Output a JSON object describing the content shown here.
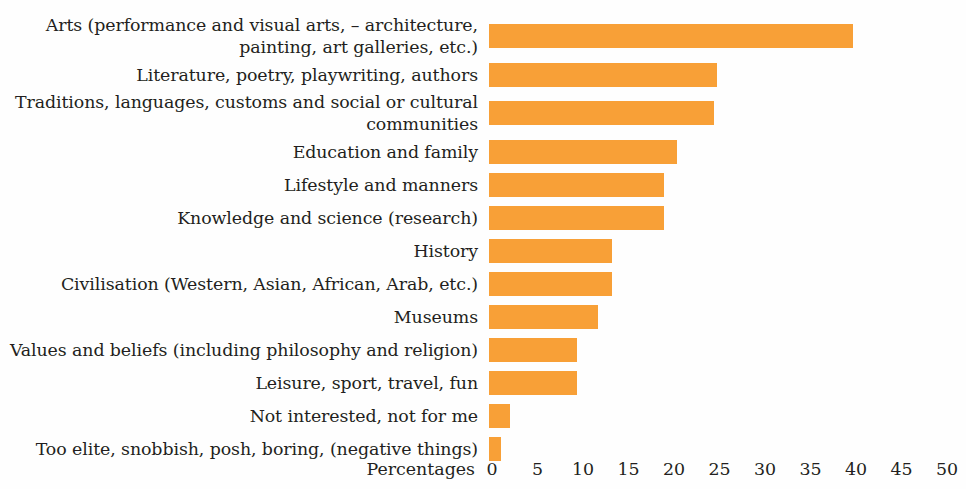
{
  "chart_data": {
    "type": "bar",
    "orientation": "horizontal",
    "title": "",
    "xlabel": "Percentages",
    "ylabel": "",
    "xlim": [
      0,
      50
    ],
    "xticks": [
      0,
      5,
      10,
      15,
      20,
      25,
      30,
      35,
      40,
      45,
      50
    ],
    "grid": false,
    "legend": null,
    "bar_color": "#f8a037",
    "categories": [
      "Arts (performance and visual arts, – architecture,\npainting, art galleries, etc.)",
      "Literature, poetry, playwriting, authors",
      "Traditions, languages, customs and social or cultural\ncommunities",
      "Education and family",
      "Lifestyle and manners",
      "Knowledge and science (research)",
      "History",
      "Civilisation (Western, Asian, African, Arab, etc.)",
      "Museums",
      "Values and beliefs (including philosophy and religion)",
      "Leisure, sport, travel, fun",
      "Not interested, not for me",
      "Too elite, snobbish, posh, boring, (negative things)"
    ],
    "values": [
      40,
      25,
      24.7,
      20.7,
      19.2,
      19.2,
      13.5,
      13.5,
      12,
      9.7,
      9.7,
      2.3,
      1.3
    ]
  }
}
